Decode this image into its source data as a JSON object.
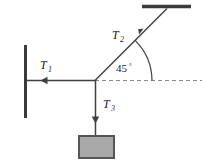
{
  "diagram": {
    "background_color": "#ffffff",
    "line_color": "#3f3f3f",
    "wall_color": "#3a3a3a",
    "block_fill": "#a8a8a8",
    "block_stroke": "#555555",
    "dash_color": "#8a8a8a",
    "labels": {
      "t1": "T",
      "t1_sub": "1",
      "t2": "T",
      "t2_sub": "2",
      "t3": "T",
      "t3_sub": "3",
      "angle": "45",
      "angle_unit": "°"
    },
    "geometry": {
      "junction": {
        "x": 95,
        "y": 80
      },
      "left_wall": {
        "x": 25,
        "y_top": 45,
        "y_bottom": 118
      },
      "top_wall": {
        "x_left": 142,
        "x_right": 191,
        "y": 6
      },
      "t1_arrow_tip": {
        "x": 47,
        "y": 80
      },
      "t2_arrow_tip": {
        "x": 142,
        "y": 30
      },
      "t3_arrow_tip": {
        "x": 95,
        "y": 121
      },
      "block": {
        "x": 79,
        "y": 136,
        "width": 35,
        "height": 22
      },
      "dashed_line": {
        "x_start": 95,
        "x_end": 202,
        "y": 80
      },
      "angle_arc_radius": 57,
      "angle_value_degrees": 45
    }
  }
}
